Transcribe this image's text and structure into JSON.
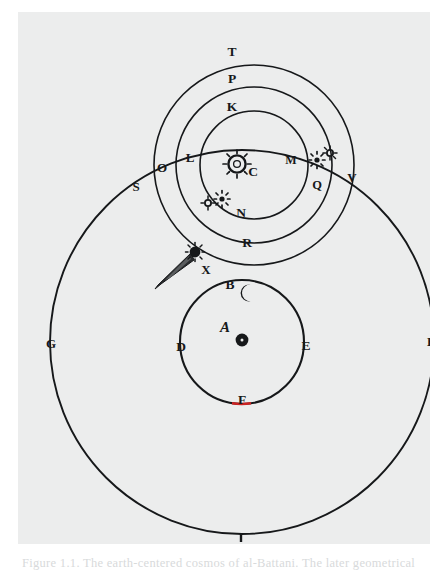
{
  "figure": {
    "caption": "Figure 1.1. The earth-centered cosmos of al-Battani. The later geometrical"
  },
  "colors": {
    "ink": "#16181a",
    "paper": "#eceded",
    "page": "#ffffff",
    "accent_red": "#cc2222",
    "caption_text": "#d8dadb"
  },
  "labels": [
    {
      "id": "T",
      "text": "T",
      "x": 214,
      "y": 44,
      "note": "top of outermost solar-system orb"
    },
    {
      "id": "P",
      "text": "P",
      "x": 214,
      "y": 70,
      "note": "top of second orb"
    },
    {
      "id": "K",
      "text": "K",
      "x": 214,
      "y": 98,
      "note": "top of third orb"
    },
    {
      "id": "C",
      "text": "C",
      "x": 234,
      "y": 159,
      "note": "the Sun, centre of the planetary orbs"
    },
    {
      "id": "M",
      "text": "M",
      "x": 272,
      "y": 152,
      "note": "right side, inner orb"
    },
    {
      "id": "Q",
      "text": "Q",
      "x": 298,
      "y": 176,
      "note": "right side, planet position"
    },
    {
      "id": "V",
      "text": "V",
      "x": 334,
      "y": 170,
      "note": "right intersection of great circle"
    },
    {
      "id": "N",
      "text": "N",
      "x": 223,
      "y": 203,
      "note": "bottom of third orb"
    },
    {
      "id": "R",
      "text": "R",
      "x": 228,
      "y": 233,
      "note": "bottom of second orb"
    },
    {
      "id": "L",
      "text": "L",
      "x": 172,
      "y": 150,
      "note": "left, inner orb crossing"
    },
    {
      "id": "O",
      "text": "O",
      "x": 144,
      "y": 159,
      "note": "left, middle orb crossing"
    },
    {
      "id": "S",
      "text": "S",
      "x": 118,
      "y": 177,
      "note": "left, outer orb crossing"
    },
    {
      "id": "X",
      "text": "X",
      "x": 187,
      "y": 259,
      "note": "the comet"
    },
    {
      "id": "B",
      "text": "B",
      "x": 212,
      "y": 275,
      "note": "the Moon on its orbit"
    },
    {
      "id": "A",
      "text": "A",
      "x": 207,
      "y": 318,
      "note": "the Earth at the centre"
    },
    {
      "id": "D",
      "text": "D",
      "x": 163,
      "y": 336,
      "note": "left of lunar orbit"
    },
    {
      "id": "E",
      "text": "E",
      "x": 287,
      "y": 335,
      "note": "right of lunar orbit"
    },
    {
      "id": "F",
      "text": "F",
      "x": 224,
      "y": 389,
      "note": "bottom of lunar orbit, red mark"
    },
    {
      "id": "G",
      "text": "G",
      "x": 33,
      "y": 333,
      "note": "left of great circle"
    },
    {
      "id": "H",
      "text": "H",
      "x": 415,
      "y": 331,
      "note": "right of great circle"
    },
    {
      "id": "I",
      "text": "I",
      "x": 222,
      "y": 528,
      "note": "bottom of great circle"
    }
  ],
  "circles": [
    {
      "id": "great-circle",
      "name": "great outer circle G-H-I",
      "cx": 224,
      "cy": 330,
      "r": 192
    },
    {
      "id": "orb-T",
      "name": "outermost solar orb T",
      "cx": 236,
      "cy": 153,
      "r": 100
    },
    {
      "id": "orb-P",
      "name": "second solar orb P",
      "cx": 236,
      "cy": 153,
      "r": 78
    },
    {
      "id": "orb-K",
      "name": "third solar orb K",
      "cx": 236,
      "cy": 153,
      "r": 54
    },
    {
      "id": "lunar-orbit",
      "name": "lunar orbit B-D-E-F",
      "cx": 224,
      "cy": 330,
      "r": 62
    }
  ],
  "bodies": [
    {
      "id": "sun",
      "name": "sun-symbol",
      "label": "C",
      "x": 219,
      "y": 152
    },
    {
      "id": "earth",
      "name": "earth-dot",
      "label": "A",
      "x": 223,
      "y": 327
    },
    {
      "id": "moon",
      "name": "moon-crescent",
      "label": "B",
      "x": 228,
      "y": 281
    },
    {
      "id": "comet",
      "name": "comet-with-tail",
      "label": "X",
      "x": 175,
      "y": 243
    },
    {
      "id": "planet-left-1",
      "name": "planet-star-symbol",
      "x": 190,
      "y": 190
    },
    {
      "id": "planet-left-2",
      "name": "planet-star-symbol",
      "x": 204,
      "y": 187
    },
    {
      "id": "planet-right-1",
      "name": "planet-star-symbol",
      "x": 300,
      "y": 146
    },
    {
      "id": "planet-right-2",
      "name": "planet-star-symbol",
      "x": 312,
      "y": 141
    }
  ]
}
